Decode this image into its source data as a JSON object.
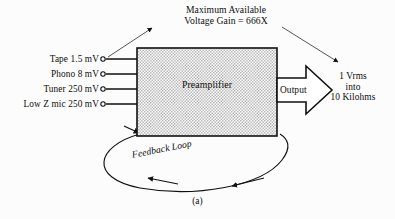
{
  "figure": {
    "caption": "(a)",
    "block": {
      "label": "Preamplifier",
      "fill": "#d8d8d8",
      "stroke": "#111111"
    },
    "annotation": {
      "line1": "Maximum Available",
      "line2": "Voltage Gain = 666X"
    },
    "inputs": [
      {
        "label": "Tape 1.5 mV"
      },
      {
        "label": "Phono 8 mV"
      },
      {
        "label": "Tuner 250 mV"
      },
      {
        "label": "Low Z mic 250 mV"
      }
    ],
    "output": {
      "arrow_label": "Output",
      "spec_line1": "1 Vrms",
      "spec_line2": "into",
      "spec_line3": "10 Kilohms"
    },
    "feedback": {
      "label": "Feedback Loop"
    },
    "colors": {
      "background": "#fcfcfc",
      "ink": "#111111"
    }
  }
}
